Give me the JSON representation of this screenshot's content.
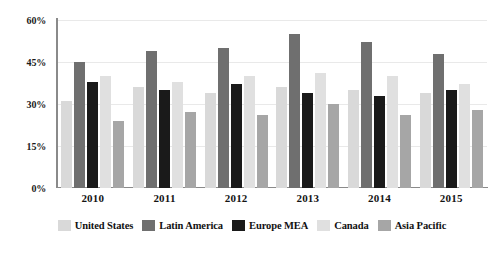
{
  "chart_data": {
    "type": "bar",
    "title": "",
    "subtitle": "",
    "xlabel": "",
    "ylabel": "",
    "categories": [
      "2010",
      "2011",
      "2012",
      "2013",
      "2014",
      "2015"
    ],
    "series": [
      {
        "name": "United States",
        "color": "#d9d9d9",
        "values": [
          31,
          36,
          34,
          36,
          35,
          34
        ]
      },
      {
        "name": "Latin America",
        "color": "#6f6f6f",
        "values": [
          45,
          49,
          50,
          55,
          52,
          48
        ]
      },
      {
        "name": "Europe MEA",
        "color": "#1a1a1a",
        "values": [
          38,
          35,
          37,
          34,
          33,
          35
        ]
      },
      {
        "name": "Canada",
        "color": "#e0e0e0",
        "values": [
          40,
          38,
          40,
          41,
          40,
          37
        ]
      },
      {
        "name": "Asia Pacific",
        "color": "#a6a6a6",
        "values": [
          24,
          27,
          26,
          30,
          26,
          28
        ]
      }
    ],
    "ylim": [
      0,
      60
    ],
    "y_ticks": [
      "0%",
      "15%",
      "30%",
      "45%",
      "60%"
    ],
    "y_tick_values": [
      0,
      15,
      30,
      45,
      60
    ],
    "grid": true,
    "legend_position": "bottom",
    "value_suffix": "%"
  }
}
